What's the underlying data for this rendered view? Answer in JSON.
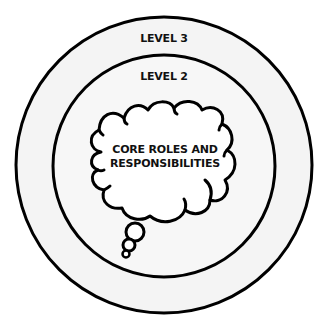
{
  "diagram": {
    "type": "concentric-levels",
    "levels": [
      {
        "id": "level3",
        "label": "LEVEL 3",
        "ring": "outer"
      },
      {
        "id": "level2",
        "label": "LEVEL 2",
        "ring": "inner"
      }
    ],
    "core": {
      "shape": "thought-bubble",
      "line1": "CORE ROLES AND",
      "line2": "RESPONSIBILITIES"
    },
    "colors": {
      "background": "#ffffff",
      "ring_fill": "#f4f4f4",
      "stroke": "#000000",
      "text": "#111111"
    }
  }
}
